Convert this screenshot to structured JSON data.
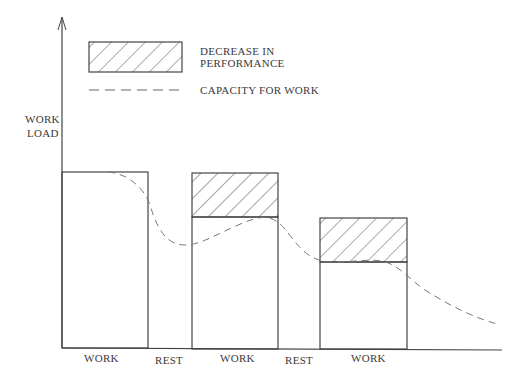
{
  "legend": {
    "decrease_label_line1": "DECREASE IN",
    "decrease_label_line2": "PERFORMANCE",
    "capacity_label": "CAPACITY FOR WORK"
  },
  "axis": {
    "y_label_line1": "WORK",
    "y_label_line2": "LOAD"
  },
  "phases": [
    {
      "label": "WORK"
    },
    {
      "label": "REST"
    },
    {
      "label": "WORK"
    },
    {
      "label": "REST"
    },
    {
      "label": "WORK"
    }
  ],
  "colors": {
    "line": "#444444",
    "dash": "#777777",
    "background": "#ffffff"
  }
}
